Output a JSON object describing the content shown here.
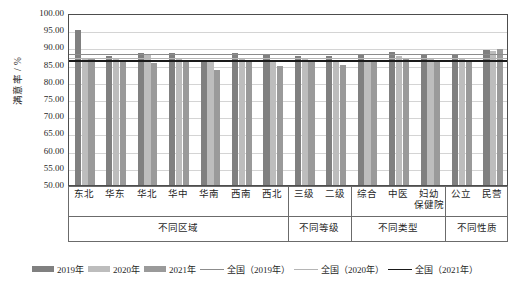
{
  "chart_data": {
    "type": "bar",
    "title": "",
    "xlabel": "",
    "ylabel": "满意率 / %",
    "ylim": [
      50.0,
      100.0
    ],
    "ytick_labels": [
      "100.00",
      "95.00",
      "90.00",
      "85.00",
      "80.00",
      "75.00",
      "70.00",
      "65.00",
      "60.00",
      "55.00",
      "50.00"
    ],
    "ytick_values": [
      100,
      95,
      90,
      85,
      80,
      75,
      70,
      65,
      60,
      55,
      50
    ],
    "grid": true,
    "legend_position": "bottom",
    "categories": [
      "东北",
      "华东",
      "华北",
      "华中",
      "华南",
      "西南",
      "西北",
      "三级",
      "二级",
      "综合",
      "中医",
      "妇幼保健院",
      "公立",
      "民营"
    ],
    "groups": [
      {
        "label": "不同区域",
        "categories": [
          "东北",
          "华东",
          "华北",
          "华中",
          "华南",
          "西南",
          "西北"
        ]
      },
      {
        "label": "不同等级",
        "categories": [
          "三级",
          "二级"
        ]
      },
      {
        "label": "不同类型",
        "categories": [
          "综合",
          "中医",
          "妇幼保健院"
        ]
      },
      {
        "label": "不同性质",
        "categories": [
          "公立",
          "民营"
        ]
      }
    ],
    "series": [
      {
        "name": "2019年",
        "color": "#808080",
        "values": [
          95.5,
          88.1,
          89.0,
          88.9,
          86.7,
          88.9,
          88.5,
          88.2,
          88.1,
          88.3,
          89.3,
          88.3,
          88.4,
          89.8
        ]
      },
      {
        "name": "2020年",
        "color": "#bdbdbd",
        "values": [
          87.2,
          87.2,
          88.4,
          87.1,
          86.5,
          87.6,
          87.0,
          87.1,
          86.9,
          87.0,
          88.0,
          87.3,
          87.1,
          89.4
        ]
      },
      {
        "name": "2021年",
        "color": "#9a9a9a",
        "values": [
          87.3,
          86.2,
          86.0,
          86.6,
          83.9,
          86.3,
          85.3,
          86.5,
          85.6,
          86.2,
          87.6,
          86.3,
          86.3,
          90.1
        ]
      }
    ],
    "reference_lines": [
      {
        "name": "全国（2019年）",
        "color": "#8c8c8c",
        "value": 88.6,
        "width": 1
      },
      {
        "name": "全国（2020年）",
        "color": "#b5b5b5",
        "value": 87.5,
        "width": 1
      },
      {
        "name": "全国（2021年）",
        "color": "#1a1a1a",
        "value": 86.8,
        "width": 1.6
      }
    ]
  },
  "legend": {
    "items": [
      {
        "label": "2019年",
        "type": "bar",
        "color": "#808080"
      },
      {
        "label": "2020年",
        "type": "bar",
        "color": "#bdbdbd"
      },
      {
        "label": "2021年",
        "type": "bar",
        "color": "#9a9a9a"
      },
      {
        "label": "全国（2019年）",
        "type": "line",
        "color": "#8c8c8c"
      },
      {
        "label": "全国（2020年）",
        "type": "line",
        "color": "#b5b5b5"
      },
      {
        "label": "全国（2021年）",
        "type": "line",
        "color": "#1a1a1a"
      }
    ]
  }
}
